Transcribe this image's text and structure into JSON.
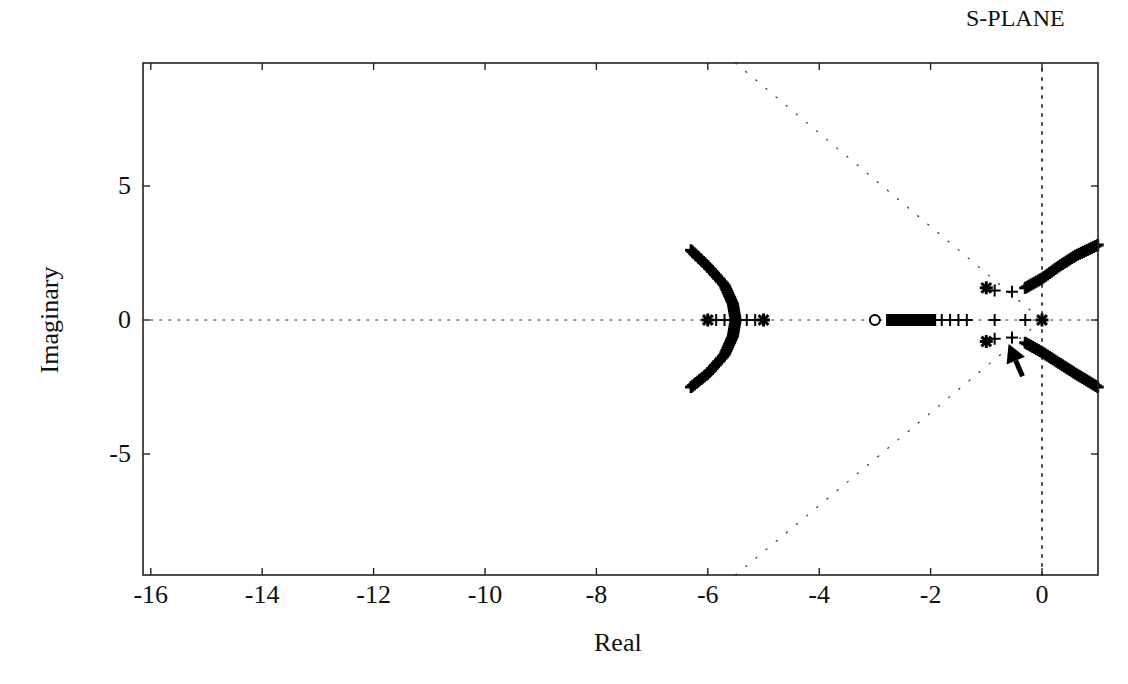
{
  "chart_data": {
    "type": "scatter",
    "title": "S-PLANE",
    "xlabel": "Real",
    "ylabel": "Imaginary",
    "xlim": [
      -16,
      1
    ],
    "ylim": [
      -9.6,
      9.6
    ],
    "grid": false,
    "x_ticks": [
      -16,
      -14,
      -12,
      -10,
      -8,
      -6,
      -4,
      -2,
      0
    ],
    "x_tick_labels": [
      "-16",
      "-14",
      "-12",
      "-10",
      "-8",
      "-6",
      "-4",
      "-2",
      "0"
    ],
    "y_ticks": [
      5,
      0,
      -5
    ],
    "y_tick_labels": [
      "5",
      "0",
      "-5"
    ],
    "reference_lines": [
      {
        "name": "real-axis",
        "style": "dotted",
        "from": [
          -16,
          0
        ],
        "to": [
          1,
          0
        ]
      },
      {
        "name": "imag-axis",
        "style": "dotted",
        "from": [
          0,
          -9.6
        ],
        "to": [
          0,
          9.6
        ]
      },
      {
        "name": "damping-line-upper",
        "style": "dotted",
        "from": [
          -5.5,
          9.6
        ],
        "to": [
          0,
          0
        ]
      },
      {
        "name": "damping-line-lower",
        "style": "dotted",
        "from": [
          -5.5,
          -9.6
        ],
        "to": [
          0,
          0
        ]
      }
    ],
    "series": [
      {
        "name": "open-loop-poles",
        "marker": "asterisk",
        "points": [
          [
            -6.0,
            0
          ],
          [
            -5.0,
            0
          ],
          [
            0.0,
            0
          ],
          [
            -1.0,
            1.2
          ],
          [
            -1.0,
            -0.8
          ]
        ]
      },
      {
        "name": "open-loop-zeros",
        "marker": "circle",
        "points": [
          [
            -3.0,
            0
          ]
        ]
      },
      {
        "name": "locus-left-branch",
        "marker": "plus-dense",
        "points": [
          [
            -6.3,
            2.6
          ],
          [
            -6.0,
            2.0
          ],
          [
            -5.7,
            1.3
          ],
          [
            -5.55,
            0.6
          ],
          [
            -5.5,
            0
          ],
          [
            -5.55,
            -0.6
          ],
          [
            -5.7,
            -1.3
          ],
          [
            -6.0,
            -2.0
          ],
          [
            -6.3,
            -2.5
          ]
        ]
      },
      {
        "name": "locus-left-real-segment",
        "marker": "plus",
        "points": [
          [
            -5.85,
            0
          ],
          [
            -5.7,
            0
          ],
          [
            -5.3,
            0
          ],
          [
            -5.15,
            0
          ]
        ]
      },
      {
        "name": "locus-real-to-zero",
        "marker": "plus-dense",
        "points": [
          [
            -2.8,
            0
          ],
          [
            -2.5,
            0
          ],
          [
            -2.2,
            0
          ],
          [
            -1.9,
            0
          ],
          [
            -1.8,
            0
          ],
          [
            -1.65,
            0
          ],
          [
            -1.5,
            0
          ],
          [
            -1.35,
            0
          ],
          [
            -0.85,
            0
          ],
          [
            -0.3,
            0
          ]
        ]
      },
      {
        "name": "locus-upper-branch",
        "marker": "plus-dense",
        "points": [
          [
            -0.85,
            1.1
          ],
          [
            -0.5,
            1.05
          ],
          [
            -0.3,
            1.2
          ],
          [
            0.0,
            1.55
          ],
          [
            0.3,
            2.0
          ],
          [
            0.6,
            2.4
          ],
          [
            1.0,
            2.8
          ]
        ]
      },
      {
        "name": "locus-lower-branch",
        "marker": "plus-dense",
        "points": [
          [
            -0.85,
            -0.7
          ],
          [
            -0.5,
            -0.65
          ],
          [
            -0.3,
            -0.85
          ],
          [
            0.0,
            -1.2
          ],
          [
            0.3,
            -1.6
          ],
          [
            0.6,
            -2.0
          ],
          [
            1.0,
            -2.5
          ]
        ]
      }
    ],
    "annotations": [
      {
        "name": "pointer-arrow",
        "type": "arrow",
        "tip": [
          -0.6,
          -0.9
        ],
        "tail": [
          -0.35,
          -2.1
        ]
      }
    ]
  }
}
